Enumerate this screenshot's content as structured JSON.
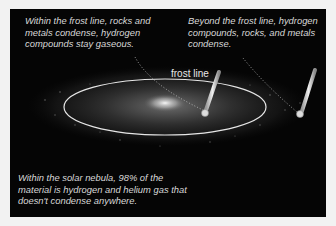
{
  "captions": {
    "inner": "Within the frost line, rocks and metals condense, hydrogen compounds stay gaseous.",
    "outer": "Beyond the frost line, hydrogen compounds, rocks, and metals condense.",
    "bottom": "Within the solar nebula, 98% of the material is hydrogen and helium gas that doesn't condense anywhere."
  },
  "labels": {
    "frost_line": "frost line"
  },
  "colors": {
    "background": "#050505",
    "text": "#d8d8d8",
    "ring": "#e6e6e6",
    "border": "#f2f2f2"
  }
}
